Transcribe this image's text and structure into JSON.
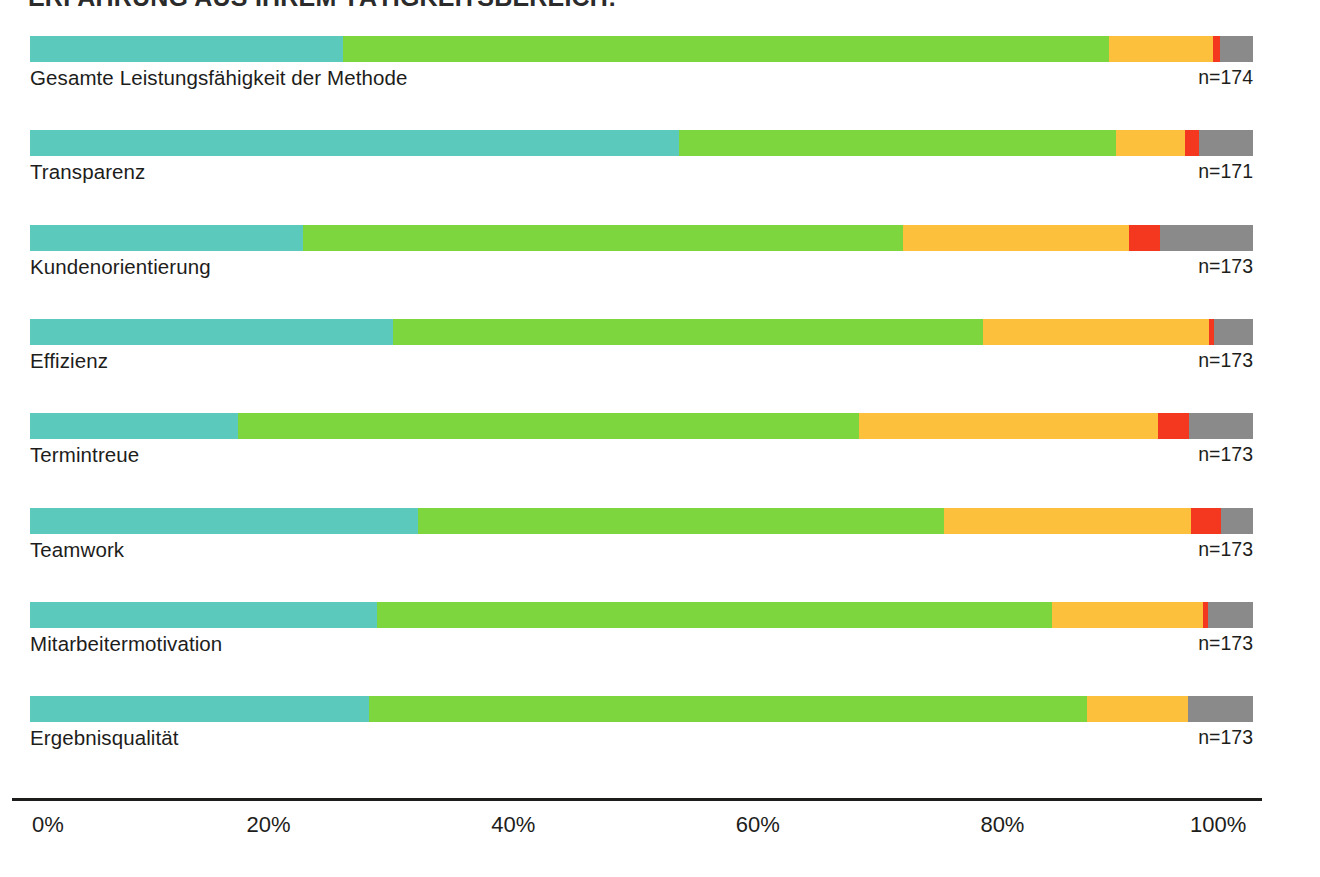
{
  "title": "ERFAHRUNG AUS IHREM TÄTIGKEITSBEREICH:",
  "colors": {
    "teal": "#5cc9bd",
    "green": "#7ed63f",
    "yellow": "#fcc03c",
    "red": "#f4371f",
    "gray": "#8a8a8a",
    "axis": "#1d1d1b",
    "text": "#1d1d1b",
    "background": "#ffffff"
  },
  "axis": {
    "ticks": [
      "0%",
      "20%",
      "40%",
      "60%",
      "80%",
      "100%"
    ],
    "tick_values": [
      0,
      20,
      40,
      60,
      80,
      100
    ]
  },
  "chart_data": {
    "type": "bar",
    "title": "ERFAHRUNG AUS IHREM TÄTIGKEITSBEREICH:",
    "subtype": "stacked-horizontal-100-percent",
    "xlabel": "",
    "ylabel": "",
    "xlim": [
      0,
      100
    ],
    "grid": false,
    "legend_position": "none",
    "categories": [
      "Gesamte Leistungsfähigkeit der Methode",
      "Transparenz",
      "Kundenorientierung",
      "Effizienz",
      "Termintreue",
      "Teamwork",
      "Mitarbeitermotivation",
      "Ergebnisqualität"
    ],
    "sample_sizes": [
      "n=174",
      "n=171",
      "n=173",
      "n=173",
      "n=173",
      "n=173",
      "n=173",
      "n=173"
    ],
    "series": [
      {
        "name": "teal",
        "color": "#5cc9bd",
        "values": [
          25.6,
          53.1,
          22.3,
          29.7,
          17.0,
          31.7,
          28.4,
          27.7
        ]
      },
      {
        "name": "green",
        "color": "#7ed63f",
        "values": [
          62.6,
          35.7,
          49.1,
          48.2,
          50.8,
          43.0,
          55.2,
          58.7
        ]
      },
      {
        "name": "yellow",
        "color": "#fcc03c",
        "values": [
          8.5,
          5.6,
          18.5,
          18.5,
          24.4,
          20.2,
          12.3,
          8.3
        ]
      },
      {
        "name": "red",
        "color": "#f4371f",
        "values": [
          0.6,
          1.2,
          2.5,
          0.4,
          2.6,
          2.5,
          0.4,
          0.0
        ]
      },
      {
        "name": "gray",
        "color": "#8a8a8a",
        "values": [
          2.7,
          4.4,
          7.6,
          3.2,
          5.2,
          2.6,
          3.7,
          5.3
        ]
      }
    ],
    "rows": [
      {
        "label": "Gesamte Leistungsfähigkeit der Methode",
        "n": "n=174",
        "segments": [
          25.6,
          62.6,
          8.5,
          0.6,
          2.7
        ]
      },
      {
        "label": "Transparenz",
        "n": "n=171",
        "segments": [
          53.1,
          35.7,
          5.6,
          1.2,
          4.4
        ]
      },
      {
        "label": "Kundenorientierung",
        "n": "n=173",
        "segments": [
          22.3,
          49.1,
          18.5,
          2.5,
          7.6
        ]
      },
      {
        "label": "Effizienz",
        "n": "n=173",
        "segments": [
          29.7,
          48.2,
          18.5,
          0.4,
          3.2
        ]
      },
      {
        "label": "Termintreue",
        "n": "n=173",
        "segments": [
          17.0,
          50.8,
          24.4,
          2.6,
          5.2
        ]
      },
      {
        "label": "Teamwork",
        "n": "n=173",
        "segments": [
          31.7,
          43.0,
          20.2,
          2.5,
          2.6
        ]
      },
      {
        "label": "Mitarbeitermotivation",
        "n": "n=173",
        "segments": [
          28.4,
          55.2,
          12.3,
          0.4,
          3.7
        ]
      },
      {
        "label": "Ergebnisqualität",
        "n": "n=173",
        "segments": [
          27.7,
          58.7,
          8.3,
          0.0,
          5.3
        ]
      }
    ]
  }
}
